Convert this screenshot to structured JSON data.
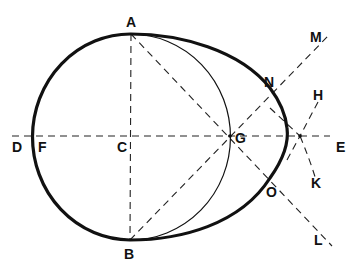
{
  "diagram": {
    "colors": {
      "stroke": "#111111",
      "background": "#ffffff"
    },
    "points": {
      "A": {
        "label": "A",
        "x": 131,
        "y": 34
      },
      "B": {
        "label": "B",
        "x": 130,
        "y": 240
      },
      "C": {
        "label": "C",
        "x": 130,
        "y": 137
      },
      "D": {
        "label": "D",
        "x": 12,
        "y": 137
      },
      "E": {
        "label": "E",
        "x": 340,
        "y": 137
      },
      "F": {
        "label": "F",
        "x": 34,
        "y": 137
      },
      "G": {
        "label": "G",
        "x": 230,
        "y": 137
      },
      "H": {
        "label": "H",
        "x": 316,
        "y": 98
      },
      "K": {
        "label": "K",
        "x": 316,
        "y": 182
      },
      "L": {
        "label": "L",
        "x": 325,
        "y": 240
      },
      "M": {
        "label": "M",
        "x": 325,
        "y": 35
      },
      "N": {
        "label": "N",
        "x": 270,
        "y": 85
      },
      "O": {
        "label": "O",
        "x": 272,
        "y": 186
      }
    },
    "labels": [
      "A",
      "B",
      "C",
      "D",
      "E",
      "F",
      "G",
      "H",
      "K",
      "L",
      "M",
      "N",
      "O"
    ]
  }
}
